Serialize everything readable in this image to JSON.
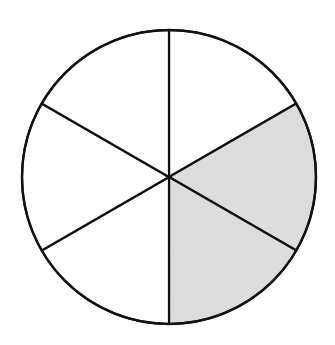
{
  "diagram": {
    "type": "fraction-circle",
    "total_sections": 6,
    "shaded_sections": 2,
    "shaded_indices": [
      1,
      2
    ],
    "center": [
      169,
      177
    ],
    "radius": 147,
    "colors": {
      "background": "#ffffff",
      "stroke": "#111111",
      "shaded_fill": "#dcdcdc",
      "unshaded_fill": "#ffffff"
    }
  }
}
